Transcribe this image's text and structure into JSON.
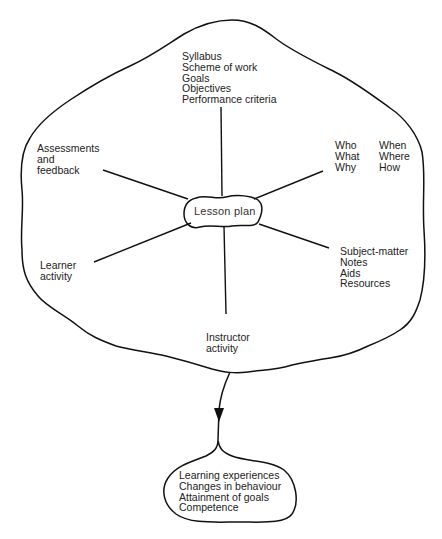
{
  "diagram": {
    "center": {
      "label": "Lesson plan"
    },
    "nodes": {
      "top": [
        "Syllabus",
        "Scheme of work",
        "Goals",
        "Objectives",
        "Performance criteria"
      ],
      "upper_left": [
        "Assessments",
        "and",
        "feedback"
      ],
      "upper_right_col1": [
        "Who",
        "What",
        "Why"
      ],
      "upper_right_col2": [
        "When",
        "Where",
        "How"
      ],
      "lower_left": [
        "Learner",
        "activity"
      ],
      "lower_right": [
        "Subject-matter",
        "Notes",
        "Aids",
        "Resources"
      ],
      "bottom": [
        "Instructor",
        "activity"
      ]
    },
    "outcome": {
      "items": [
        "Learning experiences",
        "Changes in behaviour",
        "Attainment of goals",
        "Competence"
      ]
    },
    "colors": {
      "line": "#111111",
      "text": "#222222",
      "background": "#ffffff"
    }
  }
}
